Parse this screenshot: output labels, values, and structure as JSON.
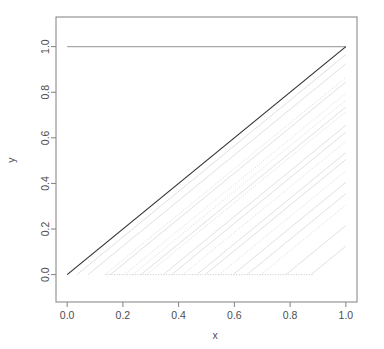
{
  "chart_data": {
    "type": "line",
    "title": "",
    "subtitle": "",
    "xlabel": "x",
    "ylabel": "y",
    "xlim": [
      -0.04,
      1.04
    ],
    "ylim": [
      -0.12,
      1.13
    ],
    "xticks": [
      0.0,
      0.2,
      0.4,
      0.6,
      0.8,
      1.0
    ],
    "yticks": [
      0.0,
      0.2,
      0.4,
      0.6,
      0.8,
      1.0
    ],
    "xtick_labels": [
      "0.0",
      "0.2",
      "0.4",
      "0.6",
      "0.8",
      "1.0"
    ],
    "ytick_labels": [
      "0.0",
      "0.2",
      "0.4",
      "0.6",
      "0.8",
      "1.0"
    ],
    "grid": false,
    "legend": "none",
    "box_style": "full-rectangle",
    "colors": {
      "emphasis_line": "#333333",
      "faint_line": "#d8d8d8",
      "dotted_line": "#c8c8c8",
      "axis": "#808080",
      "text": "#4d4d4d",
      "background": "#ffffff"
    },
    "series": [
      {
        "name": "upper-envelope",
        "style": "solid",
        "color": "#a8a8a8",
        "width": 1.4,
        "points": [
          [
            0.0,
            1.0
          ],
          [
            1.0,
            1.0
          ]
        ]
      },
      {
        "name": "identity-diagonal",
        "style": "solid",
        "color": "#333333",
        "width": 1.2,
        "points": [
          [
            0.0,
            0.0
          ],
          [
            1.0,
            1.0
          ]
        ]
      },
      {
        "name": "lower-envelope",
        "style": "dotted",
        "color": "#c8c8c8",
        "width": 1.0,
        "points": [
          [
            0.14,
            0.0
          ],
          [
            0.88,
            0.0
          ]
        ]
      },
      {
        "name": "curve-01",
        "style": "solid",
        "color": "#dcdcdc",
        "width": 0.9,
        "points": [
          [
            0.035,
            0.0
          ],
          [
            1.0,
            0.965
          ]
        ]
      },
      {
        "name": "curve-02",
        "style": "solid",
        "color": "#dcdcdc",
        "width": 0.9,
        "points": [
          [
            0.075,
            0.0
          ],
          [
            1.0,
            0.925
          ]
        ]
      },
      {
        "name": "curve-03",
        "style": "dotted",
        "color": "#d4d4d4",
        "width": 0.9,
        "points": [
          [
            0.135,
            0.0
          ],
          [
            1.0,
            0.865
          ]
        ]
      },
      {
        "name": "curve-04",
        "style": "solid",
        "color": "#dcdcdc",
        "width": 0.9,
        "points": [
          [
            0.155,
            0.0
          ],
          [
            1.0,
            0.845
          ]
        ]
      },
      {
        "name": "curve-05",
        "style": "dotted",
        "color": "#d4d4d4",
        "width": 0.9,
        "points": [
          [
            0.205,
            0.0
          ],
          [
            1.0,
            0.795
          ]
        ]
      },
      {
        "name": "curve-06",
        "style": "dotted",
        "color": "#d4d4d4",
        "width": 0.9,
        "points": [
          [
            0.235,
            0.0
          ],
          [
            1.0,
            0.765
          ]
        ]
      },
      {
        "name": "curve-07",
        "style": "solid",
        "color": "#dcdcdc",
        "width": 0.9,
        "points": [
          [
            0.265,
            0.0
          ],
          [
            1.0,
            0.735
          ]
        ]
      },
      {
        "name": "curve-08",
        "style": "dotted",
        "color": "#d4d4d4",
        "width": 0.9,
        "points": [
          [
            0.285,
            0.0
          ],
          [
            1.0,
            0.715
          ]
        ]
      },
      {
        "name": "curve-09",
        "style": "solid",
        "color": "#dcdcdc",
        "width": 0.9,
        "points": [
          [
            0.345,
            0.0
          ],
          [
            1.0,
            0.655
          ]
        ]
      },
      {
        "name": "curve-10",
        "style": "solid",
        "color": "#dcdcdc",
        "width": 0.9,
        "points": [
          [
            0.375,
            0.0
          ],
          [
            1.0,
            0.625
          ]
        ]
      },
      {
        "name": "curve-11",
        "style": "dotted",
        "color": "#d4d4d4",
        "width": 0.9,
        "points": [
          [
            0.415,
            0.0
          ],
          [
            1.0,
            0.585
          ]
        ]
      },
      {
        "name": "curve-12",
        "style": "solid",
        "color": "#dcdcdc",
        "width": 0.9,
        "points": [
          [
            0.465,
            0.0
          ],
          [
            1.0,
            0.535
          ]
        ]
      },
      {
        "name": "curve-13",
        "style": "solid",
        "color": "#dcdcdc",
        "width": 0.9,
        "points": [
          [
            0.495,
            0.0
          ],
          [
            1.0,
            0.505
          ]
        ]
      },
      {
        "name": "curve-14",
        "style": "dotted",
        "color": "#d4d4d4",
        "width": 0.9,
        "points": [
          [
            0.545,
            0.0
          ],
          [
            1.0,
            0.455
          ]
        ]
      },
      {
        "name": "curve-15",
        "style": "solid",
        "color": "#dcdcdc",
        "width": 0.9,
        "points": [
          [
            0.595,
            0.0
          ],
          [
            1.0,
            0.405
          ]
        ]
      },
      {
        "name": "curve-16",
        "style": "solid",
        "color": "#dcdcdc",
        "width": 0.9,
        "points": [
          [
            0.645,
            0.0
          ],
          [
            1.0,
            0.355
          ]
        ]
      },
      {
        "name": "curve-17",
        "style": "dotted",
        "color": "#d4d4d4",
        "width": 0.9,
        "points": [
          [
            0.695,
            0.0
          ],
          [
            1.0,
            0.305
          ]
        ]
      },
      {
        "name": "curve-18",
        "style": "solid",
        "color": "#dcdcdc",
        "width": 0.9,
        "points": [
          [
            0.785,
            0.0
          ],
          [
            1.0,
            0.215
          ]
        ]
      },
      {
        "name": "curve-19",
        "style": "solid",
        "color": "#dcdcdc",
        "width": 0.9,
        "points": [
          [
            0.875,
            0.0
          ],
          [
            1.0,
            0.125
          ]
        ]
      }
    ]
  }
}
